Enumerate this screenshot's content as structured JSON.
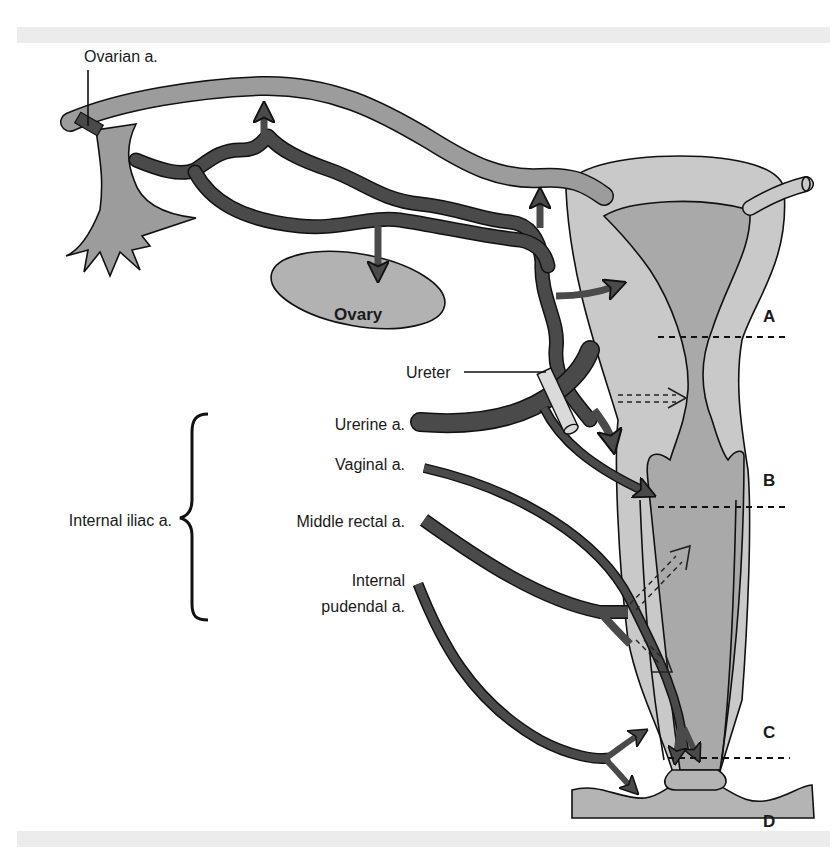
{
  "figure": {
    "labels": {
      "ovarian_artery": "Ovarian a.",
      "ovary": "Ovary",
      "ureter": "Ureter",
      "uterine_artery": "Urerine a.",
      "vaginal_artery": "Vaginal a.",
      "internal_iliac": "Internal iliac a.",
      "middle_rectal_artery": "Middle rectal a.",
      "internal_pudendal_line1": "Internal",
      "internal_pudendal_line2": "pudendal a."
    },
    "section_markers": [
      "A",
      "B",
      "C",
      "D"
    ],
    "colors": {
      "artery": "#4a4a4a",
      "tube": "#9c9c9c",
      "uterus_outer": "#c9c9c9",
      "uterus_inner": "#a9a9a9",
      "ovary": "#b2b2b2",
      "ureter": "#dadada",
      "band": "#ececec"
    }
  }
}
